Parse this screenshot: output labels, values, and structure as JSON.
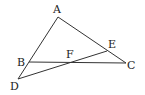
{
  "diagram": {
    "type": "geometry",
    "points": {
      "A": {
        "label": "A",
        "x": 58,
        "y": 17,
        "lx": 53,
        "ly": 13
      },
      "B": {
        "label": "B",
        "x": 29,
        "y": 62,
        "lx": 17,
        "ly": 66
      },
      "C": {
        "label": "C",
        "x": 126,
        "y": 63,
        "lx": 127,
        "ly": 69
      },
      "D": {
        "label": "D",
        "x": 18,
        "y": 79,
        "lx": 10,
        "ly": 90
      },
      "E": {
        "label": "E",
        "x": 107,
        "y": 51,
        "lx": 108,
        "ly": 48
      },
      "F": {
        "label": "F",
        "x": 72,
        "y": 62,
        "lx": 66,
        "ly": 58
      }
    },
    "segments": [
      {
        "from": "A",
        "to": "D"
      },
      {
        "from": "A",
        "to": "C"
      },
      {
        "from": "B",
        "to": "C"
      },
      {
        "from": "D",
        "to": "E"
      }
    ],
    "stroke_color": "#333333"
  }
}
